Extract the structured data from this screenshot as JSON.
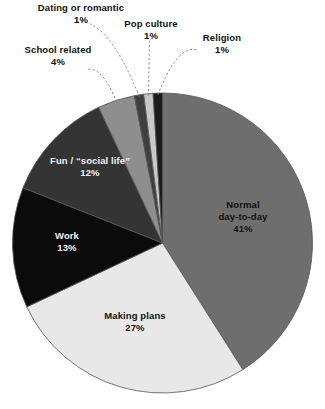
{
  "chart_data": {
    "type": "pie",
    "title": "",
    "subtitle": "",
    "xlabel": "",
    "ylabel": "",
    "legend_position": "none",
    "grid": false,
    "value_unit": "%",
    "start_angle_deg": 0,
    "direction": "clockwise",
    "categories": [
      "Normal day-to-day",
      "Making plans",
      "Work",
      "Fun / “social life”",
      "School related",
      "Dating or romantic",
      "Pop culture",
      "Religion"
    ],
    "values": [
      41,
      27,
      13,
      12,
      4,
      1,
      1,
      1
    ],
    "slices": [
      {
        "key": "normal-day-to-day",
        "label_line1": "Normal",
        "label_line2": "day-to-day",
        "value": 41,
        "value_text": "41%",
        "color": "#6e6e6e",
        "label_placement": "inside",
        "label_color": "dark"
      },
      {
        "key": "making-plans",
        "label_line1": "Making plans",
        "label_line2": "",
        "value": 27,
        "value_text": "27%",
        "color": "#e8e8e8",
        "label_placement": "inside",
        "label_color": "dark"
      },
      {
        "key": "work",
        "label_line1": "Work",
        "label_line2": "",
        "value": 13,
        "value_text": "13%",
        "color": "#0b0b0b",
        "label_placement": "inside",
        "label_color": "light"
      },
      {
        "key": "fun-social-life",
        "label_line1": "Fun / “social life”",
        "label_line2": "",
        "value": 12,
        "value_text": "12%",
        "color": "#343434",
        "label_placement": "inside",
        "label_color": "light"
      },
      {
        "key": "school-related",
        "label_line1": "School related",
        "label_line2": "",
        "value": 4,
        "value_text": "4%",
        "color": "#8e8e8e",
        "label_placement": "outside",
        "label_color": "dark"
      },
      {
        "key": "dating-or-romantic",
        "label_line1": "Dating or romantic",
        "label_line2": "",
        "value": 1,
        "value_text": "1%",
        "color": "#3f3f3f",
        "label_placement": "outside",
        "label_color": "dark"
      },
      {
        "key": "pop-culture",
        "label_line1": "Pop culture",
        "label_line2": "",
        "value": 1,
        "value_text": "1%",
        "color": "#c9c9c9",
        "label_placement": "outside",
        "label_color": "dark"
      },
      {
        "key": "religion",
        "label_line1": "Religion",
        "label_line2": "",
        "value": 1,
        "value_text": "1%",
        "color": "#1c1c1c",
        "label_placement": "outside",
        "label_color": "dark"
      }
    ]
  },
  "colors": {
    "background": "#ffffff",
    "slice_outline": "#555555",
    "leader_line": "#777777",
    "text_dark": "#111111",
    "text_light": "#f2f2f2"
  }
}
